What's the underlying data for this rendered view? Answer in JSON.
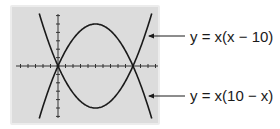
{
  "figure": {
    "labels": [
      {
        "text": "y = x(x − 10)",
        "target": "upward-parabola"
      },
      {
        "text": "y = x(10 − x)",
        "target": "downward-parabola"
      }
    ]
  },
  "chart_data": {
    "type": "line",
    "title": "",
    "xlabel": "",
    "ylabel": "",
    "grid": false,
    "xlim": [
      -5,
      15
    ],
    "ylim": [
      -30,
      30
    ],
    "axis_ticks": {
      "x_tick_count_visible": 20,
      "y_tick_count_visible": 12
    },
    "series": [
      {
        "name": "y = x(x − 10)",
        "shape": "upward parabola",
        "roots": [
          0,
          10
        ],
        "vertex": [
          5,
          -25
        ]
      },
      {
        "name": "y = x(10 − x)",
        "shape": "downward parabola",
        "roots": [
          0,
          10
        ],
        "vertex": [
          5,
          25
        ]
      }
    ],
    "annotations": [
      "y = x(x − 10)",
      "y = x(10 − x)"
    ]
  },
  "colors": {
    "panel": "#dcdcdc",
    "panel_border": "#ececec",
    "curve": "#1a1a1a",
    "text": "#1a1a1a"
  }
}
